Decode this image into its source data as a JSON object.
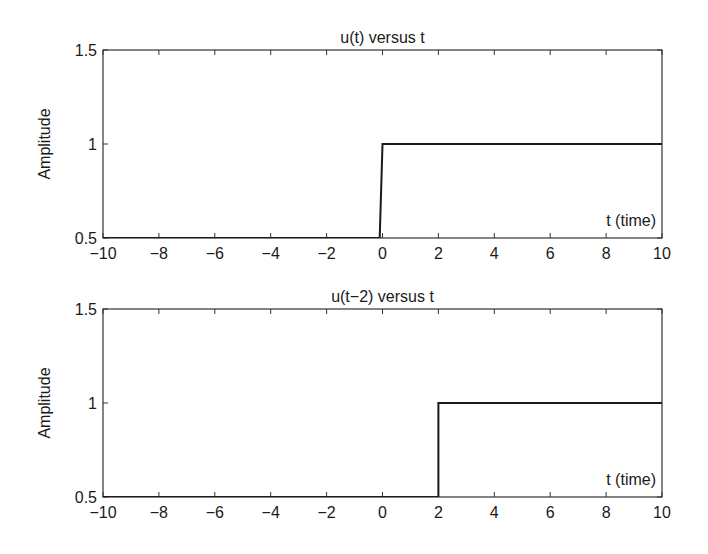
{
  "chart_data": [
    {
      "type": "line",
      "title": "u(t) versus t",
      "xlabel": "",
      "ylabel": "Amplitude",
      "annotation": "t (time)",
      "xlim": [
        -10,
        10
      ],
      "ylim": [
        0.5,
        1.5
      ],
      "xticks": [
        -10,
        -8,
        -6,
        -4,
        -2,
        0,
        2,
        4,
        6,
        8,
        10
      ],
      "xtick_labels": [
        "−10",
        "−8",
        "−6",
        "−4",
        "−2",
        "0",
        "2",
        "4",
        "6",
        "8",
        "10"
      ],
      "yticks": [
        0.5,
        1,
        1.5
      ],
      "ytick_labels": [
        "0.5",
        "1",
        "1.5"
      ],
      "grid": false,
      "series": [
        {
          "name": "u(t)",
          "x": [
            -10,
            -0.1,
            0,
            10
          ],
          "y": [
            0,
            0,
            1,
            1
          ],
          "color": "#1a1a1a"
        }
      ]
    },
    {
      "type": "line",
      "title": "u(t−2) versus t",
      "xlabel": "",
      "ylabel": "Amplitude",
      "annotation": "t (time)",
      "xlim": [
        -10,
        10
      ],
      "ylim": [
        0.5,
        1.5
      ],
      "xticks": [
        -10,
        -8,
        -6,
        -4,
        -2,
        0,
        2,
        4,
        6,
        8,
        10
      ],
      "xtick_labels": [
        "−10",
        "−8",
        "−6",
        "−4",
        "−2",
        "0",
        "2",
        "4",
        "6",
        "8",
        "10"
      ],
      "yticks": [
        0.5,
        1,
        1.5
      ],
      "ytick_labels": [
        "0.5",
        "1",
        "1.5"
      ],
      "grid": false,
      "series": [
        {
          "name": "u(t-2)",
          "x": [
            -10,
            2,
            2,
            10
          ],
          "y": [
            0,
            0,
            1,
            1
          ],
          "color": "#1a1a1a"
        }
      ]
    }
  ]
}
